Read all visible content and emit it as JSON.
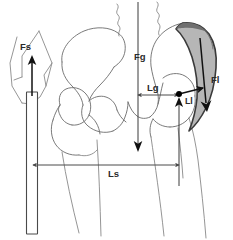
{
  "diagram": {
    "background_color": "#ffffff",
    "width": 233,
    "height": 240,
    "colors": {
      "bone_outline": "#6b6b6b",
      "muscle_fill": "#a9a9a9",
      "muscle_outline": "#3a3a3a",
      "force_arrow": "#111111",
      "dimension_line": "#4a4a4a",
      "joint_center": "#000000",
      "label_text": "#2b2b2b"
    },
    "labels": [
      {
        "id": "Fs",
        "text": "Fs",
        "meaning": "cane-support-force",
        "x": 26,
        "y": 47
      },
      {
        "id": "Fg",
        "text": "Fg",
        "meaning": "body-weight-gravity-force",
        "x": 140,
        "y": 57
      },
      {
        "id": "Lg",
        "text": "Lg",
        "meaning": "gravity-moment-arm",
        "x": 152,
        "y": 88
      },
      {
        "id": "Fl",
        "text": "Fl",
        "meaning": "abductor-muscle-force",
        "x": 214,
        "y": 80
      },
      {
        "id": "Ll",
        "text": "Ll",
        "meaning": "abductor-moment-arm",
        "x": 190,
        "y": 100
      },
      {
        "id": "Ls",
        "text": "Ls",
        "meaning": "cane-moment-arm",
        "x": 114,
        "y": 174
      }
    ],
    "elements": {
      "cane_rod": "vertical-white-rod",
      "hand": "hand-gripping-cane-outline",
      "pelvis": "pelvis-bone-outline",
      "left_femur": "left-femur-outline",
      "right_femur": "right-femur-outline",
      "abductor_muscle": "shaded-abductor-muscle-band",
      "joint_center_dot": "hip-joint-center-marker",
      "break_lines": "wavy-section-break-lines"
    }
  }
}
